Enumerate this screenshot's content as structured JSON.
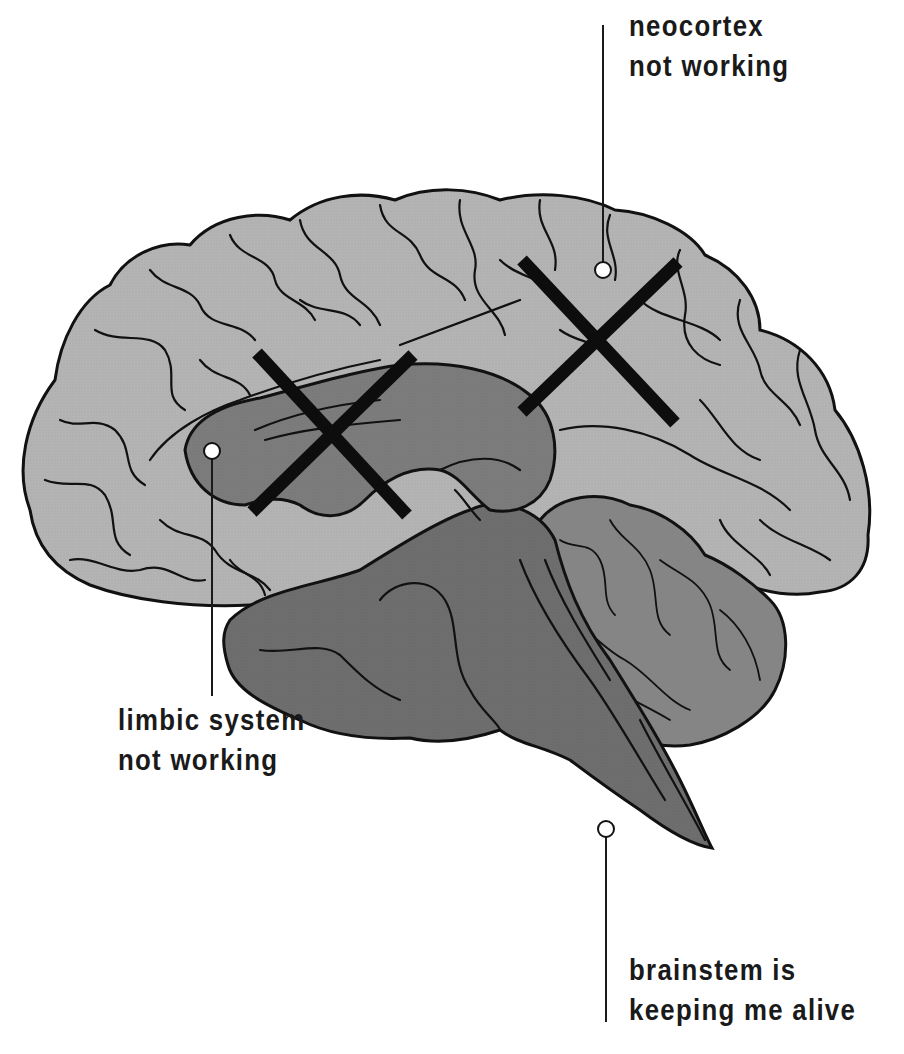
{
  "diagram": {
    "title": "",
    "colors": {
      "background": "#ffffff",
      "neocortex": "#b4b4b4",
      "limbic": "#7c7c7c",
      "brainstem": "#6e6e6e",
      "cerebellum": "#858585",
      "outline": "#111111",
      "cross_mark": "#0d0d0d",
      "marker_dot": "#ffffff"
    },
    "callouts": [
      {
        "id": "neocortex",
        "line1": "neocortex",
        "line2": "not working",
        "status": "not working",
        "crossed_out": true
      },
      {
        "id": "limbic",
        "line1": "limbic system",
        "line2": "not working",
        "status": "not working",
        "crossed_out": true
      },
      {
        "id": "brainstem",
        "line1": "brainstem is",
        "line2": "keeping me alive",
        "status": "keeping me alive",
        "crossed_out": false
      }
    ]
  }
}
